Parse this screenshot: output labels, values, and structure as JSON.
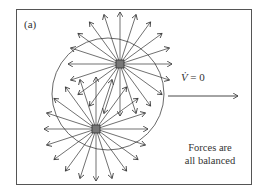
{
  "figure": {
    "panel_label": "(a)",
    "equation": {
      "symbol": "V̇",
      "rhs": "= 0"
    },
    "caption_line1": "Forces are",
    "caption_line2": "all balanced"
  },
  "geometry": {
    "frame": {
      "x": 16,
      "y": 9,
      "w": 236,
      "h": 176
    },
    "circle": {
      "cx": 108,
      "cy": 94,
      "r": 56
    },
    "nodes": [
      {
        "id": "upper",
        "cx": 120,
        "cy": 64
      },
      {
        "id": "lower",
        "cx": 96,
        "cy": 129
      }
    ],
    "velocity_arrow": {
      "x1": 168,
      "y1": 96,
      "x2": 238,
      "y2": 96
    },
    "stroke_color": "#333333"
  }
}
